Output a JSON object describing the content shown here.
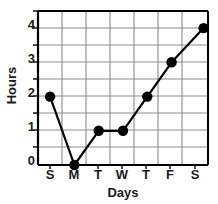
{
  "chart_data": {
    "type": "line",
    "title": "",
    "xlabel": "Days",
    "ylabel": "Hours",
    "categories": [
      "S",
      "M",
      "T",
      "W",
      "T",
      "F",
      "S"
    ],
    "values": [
      2,
      0,
      1,
      1,
      2,
      3,
      4
    ],
    "series": [
      {
        "name": "Hours",
        "values": [
          2,
          0,
          1,
          1,
          2,
          3,
          4
        ]
      }
    ],
    "points": [
      {
        "x": "S",
        "y": 2
      },
      {
        "x": "M",
        "y": 0
      },
      {
        "x": "T",
        "y": 1
      },
      {
        "x": "W",
        "y": 1
      },
      {
        "x": "T",
        "y": 2
      },
      {
        "x": "F",
        "y": 3
      },
      {
        "x": "S",
        "y": 4
      }
    ],
    "ylim": [
      0,
      4.5
    ],
    "yticks": [
      0,
      1,
      2,
      3,
      4
    ],
    "ytick_labels": [
      "0",
      "1",
      "2",
      "3",
      "4"
    ],
    "y_minor_step": 0.5,
    "grid": true,
    "legend": false,
    "legend_position": "none",
    "marker": "filled-circle",
    "line_color": "#000000",
    "marker_color": "#000000",
    "grid_color": "#8c8c8c",
    "axis_color": "#000000"
  },
  "axes": {
    "y_title": "Hours",
    "x_title": "Days"
  },
  "y_ticks": [
    {
      "label": "4",
      "value": 4
    },
    {
      "label": "3",
      "value": 3
    },
    {
      "label": "2",
      "value": 2
    },
    {
      "label": "1",
      "value": 1
    },
    {
      "label": "0",
      "value": 0
    }
  ],
  "x_ticks": [
    {
      "label": "S"
    },
    {
      "label": "M"
    },
    {
      "label": "T"
    },
    {
      "label": "W"
    },
    {
      "label": "T"
    },
    {
      "label": "F"
    },
    {
      "label": "S"
    }
  ]
}
